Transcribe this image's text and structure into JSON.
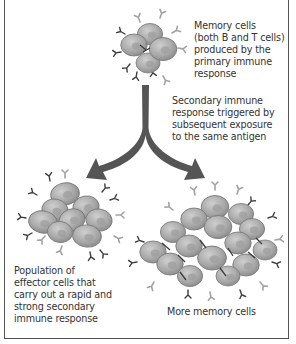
{
  "diagram": {
    "colors": {
      "border": "#555555",
      "text": "#333333",
      "arrow": "#555555",
      "cell_fill": "#a8a8a8",
      "cell_outline": "#7a7a7a",
      "antibody_light": "#a0a0a0",
      "antibody_dark": "#3a3a3a"
    },
    "nodes": [
      {
        "id": "memory-cells-top",
        "label": "Memory cells\n(both B and T cells)\nproduced by the\nprimary immune\nresponse"
      },
      {
        "id": "effector-cells",
        "label": "Population of\neffector cells that\ncarry out a rapid and\nstrong secondary\nimmune response"
      },
      {
        "id": "more-memory-cells",
        "label": "More memory cells"
      }
    ],
    "edges": [
      {
        "from": "memory-cells-top",
        "to": "effector-cells",
        "label": "Secondary immune\nresponse triggered by\nsubsequent exposure\nto the same antigen"
      },
      {
        "from": "memory-cells-top",
        "to": "more-memory-cells",
        "label": "Secondary immune\nresponse triggered by\nsubsequent exposure\nto the same antigen"
      }
    ]
  }
}
